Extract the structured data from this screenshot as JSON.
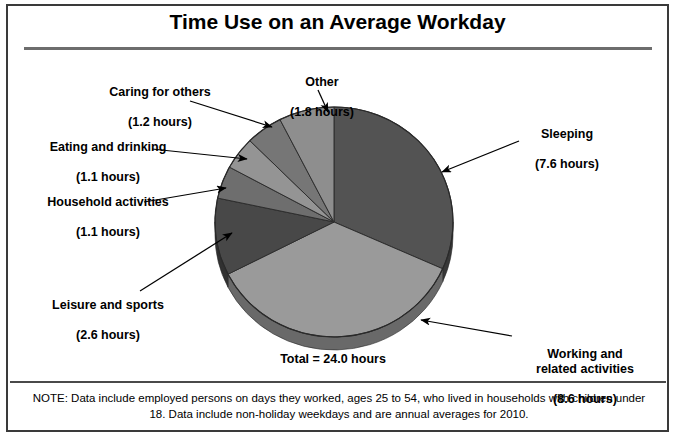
{
  "chart_data": {
    "type": "pie",
    "title": "Time Use on an Average Workday",
    "unit": "hours",
    "total_label": "Total = 24.0 hours",
    "total_value": 24.0,
    "categories": [
      "Sleeping",
      "Working and related activities",
      "Leisure and sports",
      "Household activities",
      "Eating and drinking",
      "Caring for others",
      "Other"
    ],
    "values": [
      7.6,
      8.6,
      2.6,
      1.1,
      1.1,
      1.2,
      1.8
    ],
    "value_labels": [
      "(7.6 hours)",
      "(8.6 hours)",
      "(2.6 hours)",
      "(1.1 hours)",
      "(1.1 hours)",
      "(1.2 hours)",
      "(1.8 hours)"
    ],
    "colors": [
      "#535353",
      "#9a9a9a",
      "#484848",
      "#6e6e6e",
      "#949494",
      "#767676",
      "#8e8e8e"
    ],
    "legend": "none",
    "grid": false,
    "note": "NOTE: Data include employed persons on days they worked, ages 25 to 54, who lived in households with children under 18. Data include non-holiday weekdays and are annual averages for 2010."
  },
  "header": {
    "title": "Time Use on an Average Workday"
  },
  "labels": {
    "caring": {
      "name": "Caring for others",
      "value": "(1.2 hours)"
    },
    "other": {
      "name": "Other",
      "value": "(1.8 hours)"
    },
    "eating": {
      "name": "Eating and drinking",
      "value": "(1.1 hours)"
    },
    "household": {
      "name": "Household activities",
      "value": "(1.1 hours)"
    },
    "leisure": {
      "name": "Leisure and sports",
      "value": "(2.6 hours)"
    },
    "sleeping": {
      "name": "Sleeping",
      "value": "(7.6 hours)"
    },
    "working": {
      "name": "Working and\nrelated activities",
      "value": "(8.6 hours)"
    }
  },
  "footer": {
    "total": "Total = 24.0 hours",
    "note": "NOTE: Data include employed persons on days they worked, ages 25 to 54, who lived in households with children under 18. Data include non-holiday weekdays and are annual averages for 2010."
  }
}
